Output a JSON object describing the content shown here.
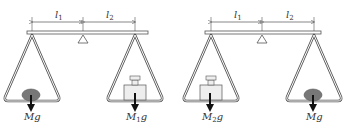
{
  "figures": [
    {
      "name": "balance-left",
      "dimension_labels": {
        "l1": "l",
        "l1_sub": "1",
        "l2": "l",
        "l2_sub": "2"
      },
      "left_pan": {
        "object": "stone",
        "force_label": "Mg",
        "force_main": "M",
        "force_sub": "",
        "force_g": "g"
      },
      "right_pan": {
        "object": "weight",
        "force_label": "M1g",
        "force_main": "M",
        "force_sub": "1",
        "force_g": "g"
      }
    },
    {
      "name": "balance-right",
      "dimension_labels": {
        "l1": "l",
        "l1_sub": "1",
        "l2": "l",
        "l2_sub": "2"
      },
      "left_pan": {
        "object": "weight",
        "force_label": "M2g",
        "force_main": "M",
        "force_sub": "2",
        "force_g": "g"
      },
      "right_pan": {
        "object": "stone",
        "force_label": "Mg",
        "force_main": "M",
        "force_sub": "",
        "force_g": "g"
      }
    }
  ],
  "colors": {
    "line": "#555555",
    "stone": "#777777",
    "weight_fill": "#eeeeee",
    "arrow": "#111111"
  }
}
